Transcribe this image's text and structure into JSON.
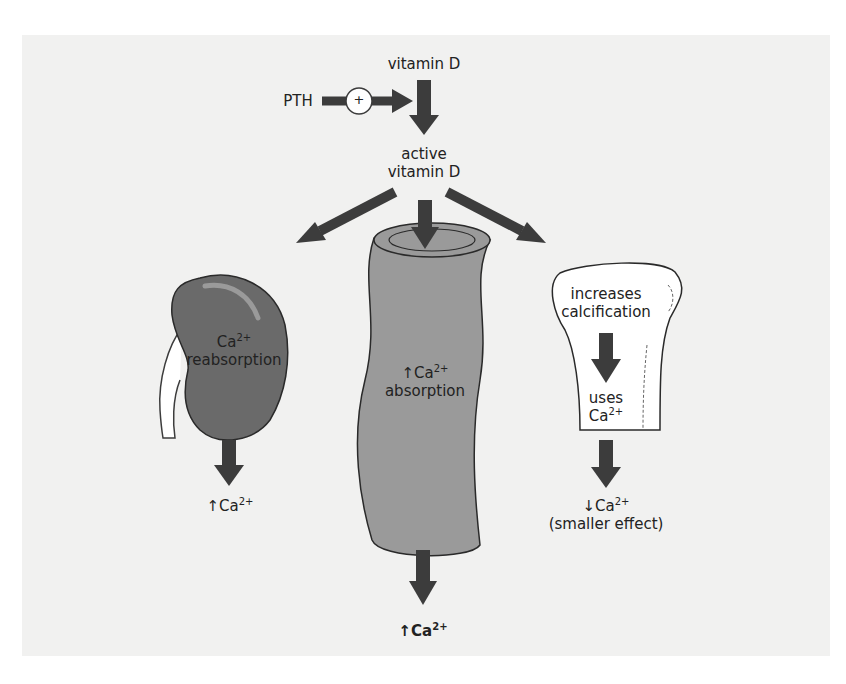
{
  "diagram": {
    "nodes": {
      "vitamin_d": "vitamin D",
      "pth": "PTH",
      "pth_effect": "+",
      "active_vitamin_d_line1": "active",
      "active_vitamin_d_line2": "vitamin D",
      "kidney": {
        "label_ion": "Ca",
        "label_charge": "2+",
        "label_line2": "reabsorption",
        "result_arrow": "↑",
        "result_ion": "Ca",
        "result_charge": "2+"
      },
      "intestine": {
        "label_arrow": "↑",
        "label_ion": "Ca",
        "label_charge": "2+",
        "label_line2": "absorption",
        "result_arrow": "↑",
        "result_ion": "Ca",
        "result_charge": "2+"
      },
      "bone": {
        "label_line1": "increases",
        "label_line2": "calcification",
        "sub_line1": "uses",
        "sub_ion": "Ca",
        "sub_charge": "2+",
        "result_arrow": "↓",
        "result_ion": "Ca",
        "result_charge": "2+",
        "result_note": "(smaller effect)"
      }
    },
    "colors": {
      "panel_bg": "#f1f1f0",
      "arrow": "#3c3c3c",
      "kidney_fill": "#6a6a6a",
      "intestine_fill": "#9a9a9a",
      "bone_fill": "#ffffff"
    }
  }
}
